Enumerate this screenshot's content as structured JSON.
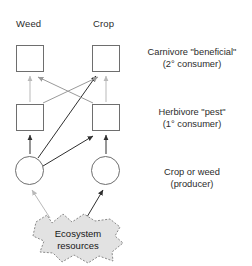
{
  "diagram": {
    "type": "food-web",
    "column_headers": [
      {
        "label": "Weed"
      },
      {
        "label": "Crop"
      }
    ],
    "trophic_levels": [
      {
        "name": "carnivore",
        "line1": "Carnivore \"beneficial\"",
        "line2": "(2° consumer)",
        "node_shape": "square",
        "nodes": [
          {
            "column": "Weed",
            "label": ""
          },
          {
            "column": "Crop",
            "label": ""
          }
        ]
      },
      {
        "name": "herbivore",
        "line1": "Herbivore \"pest\"",
        "line2": "(1° consumer)",
        "node_shape": "square",
        "nodes": [
          {
            "column": "Weed",
            "label": ""
          },
          {
            "column": "Crop",
            "label": ""
          }
        ]
      },
      {
        "name": "producer",
        "line1": "Crop or weed",
        "line2": "(producer)",
        "node_shape": "circle",
        "nodes": [
          {
            "column": "Weed",
            "label": ""
          },
          {
            "column": "Crop",
            "label": ""
          }
        ]
      }
    ],
    "resource_pool": {
      "line1": "Ecosystem",
      "line2": "resources",
      "shape": "blob",
      "border_style": "dashed",
      "fill": "#e2e2e2"
    },
    "colors": {
      "node_stroke": "#6e6e6e",
      "arrow_dark": "#2f2f2f",
      "arrow_light": "#b9b9b9",
      "arrow_mid": "#9a9a9a",
      "blob_fill": "#e2e2e2",
      "blob_stroke": "#8a8a8a",
      "text": "#2b2b2b",
      "background": "#ffffff"
    },
    "edges": [
      {
        "from": "weed-producer",
        "to": "weed-herbivore",
        "tone": "dark"
      },
      {
        "from": "weed-producer",
        "to": "crop-herbivore",
        "tone": "dark"
      },
      {
        "from": "weed-producer",
        "to": "crop-carnivore",
        "tone": "dark"
      },
      {
        "from": "crop-producer",
        "to": "crop-herbivore",
        "tone": "dark"
      },
      {
        "from": "weed-herbivore",
        "to": "weed-carnivore",
        "tone": "light"
      },
      {
        "from": "crop-herbivore",
        "to": "crop-carnivore",
        "tone": "light"
      },
      {
        "from": "crop-herbivore",
        "to": "weed-carnivore",
        "tone": "mid"
      },
      {
        "from": "weed-herbivore",
        "to": "crop-carnivore",
        "tone": "mid"
      },
      {
        "from": "ecosystem-resources",
        "to": "weed-producer",
        "tone": "light"
      },
      {
        "from": "ecosystem-resources",
        "to": "crop-producer",
        "tone": "dark"
      }
    ]
  }
}
